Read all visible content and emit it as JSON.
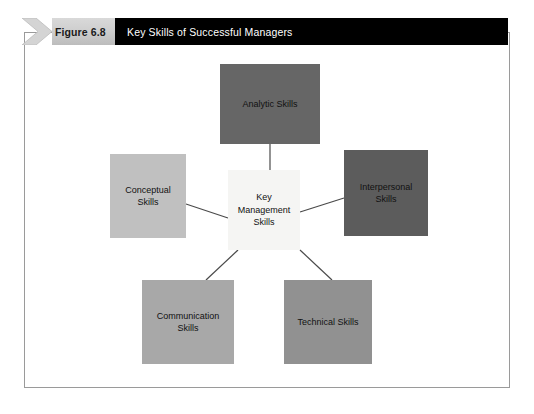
{
  "figure": {
    "number_label": "Figure 6.8",
    "title": "Key Skills of Successful Managers",
    "header_background": "#000000",
    "number_background": "#cfcfcf",
    "frame_border_color": "#9a9a9a"
  },
  "diagram": {
    "type": "hub-and-spoke",
    "center": {
      "label": "Key\nManagement\nSkills",
      "line1": "Key",
      "line2": "Management",
      "line3": "Skills",
      "color": "#f5f5f3"
    },
    "nodes": [
      {
        "id": "analytic",
        "line1": "Analytic Skills",
        "line2": "",
        "color": "#666666",
        "position": "top"
      },
      {
        "id": "conceptual",
        "line1": "Conceptual",
        "line2": "Skills",
        "color": "#c0c0c0",
        "position": "left"
      },
      {
        "id": "interpersonal",
        "line1": "Interpersonal",
        "line2": "Skills",
        "color": "#5c5c5c",
        "position": "right"
      },
      {
        "id": "communication",
        "line1": "Communication",
        "line2": "Skills",
        "color": "#a8a8a8",
        "position": "bottom-left"
      },
      {
        "id": "technical",
        "line1": "Technical Skills",
        "line2": "",
        "color": "#919191",
        "position": "bottom-right"
      }
    ],
    "connector_color": "#4a4a4a"
  }
}
